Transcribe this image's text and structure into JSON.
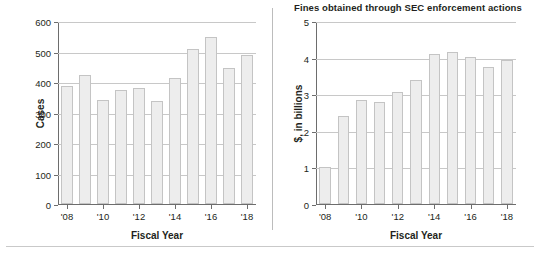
{
  "figure": {
    "divider_color": "#bcbcbc",
    "rule_color": "#c9c9c9",
    "bar_fill": "#ededed",
    "bar_stroke": "#c4c4c4",
    "axis_color": "#6d6d6d",
    "grid_color": "#c8c8c8"
  },
  "chart_data": [
    {
      "type": "bar",
      "panel": "left",
      "title": "",
      "xlabel": "Fiscal Year",
      "ylabel": "Cases",
      "categories": [
        "'08",
        "'09",
        "'10",
        "'11",
        "'12",
        "'13",
        "'14",
        "'15",
        "'16",
        "'17",
        "'18"
      ],
      "tick_labels": [
        "'08",
        "'10",
        "'12",
        "'14",
        "'16",
        "'18"
      ],
      "values": [
        386,
        424,
        341,
        375,
        379,
        338,
        413,
        507,
        548,
        446,
        490
      ],
      "ylim": [
        0,
        600
      ],
      "yticks": [
        0,
        100,
        200,
        300,
        400,
        500,
        600
      ],
      "grid": true,
      "legend": "none"
    },
    {
      "type": "bar",
      "panel": "right",
      "title": "Fines obtained through SEC enforcement actions",
      "xlabel": "Fiscal Year",
      "ylabel": "$, in billions",
      "categories": [
        "'08",
        "'09",
        "'10",
        "'11",
        "'12",
        "'13",
        "'14",
        "'15",
        "'16",
        "'17",
        "'18"
      ],
      "tick_labels": [
        "'08",
        "'10",
        "'12",
        "'14",
        "'16",
        "'18"
      ],
      "values": [
        1.02,
        2.41,
        2.83,
        2.8,
        3.07,
        3.4,
        4.1,
        4.16,
        4.03,
        3.75,
        3.93
      ],
      "ylim": [
        0,
        5
      ],
      "yticks": [
        0,
        1,
        2,
        3,
        4,
        5
      ],
      "grid": true,
      "legend": "none"
    }
  ]
}
